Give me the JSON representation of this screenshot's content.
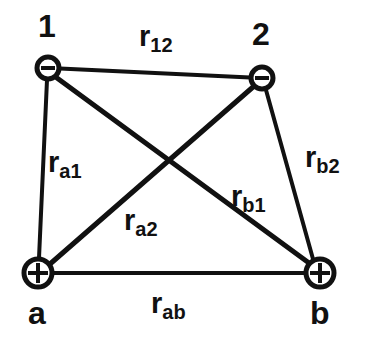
{
  "figure": {
    "background_color": "#ffffff",
    "ink_color": "#111111",
    "width": 365,
    "height": 345
  },
  "nodes": [
    {
      "id": "electron1",
      "label": "1",
      "charge_glyph": "minus",
      "charge_symbol": "−",
      "x": 48,
      "y": 68,
      "radius": 12,
      "label_x": 38,
      "label_y": 10
    },
    {
      "id": "electron2",
      "label": "2",
      "charge_glyph": "minus",
      "charge_symbol": "−",
      "x": 262,
      "y": 78,
      "radius": 12,
      "label_x": 252,
      "label_y": 18
    },
    {
      "id": "nucleusA",
      "label": "a",
      "charge_glyph": "plus",
      "charge_symbol": "+",
      "x": 38,
      "y": 273,
      "radius": 15,
      "label_x": 28,
      "label_y": 297
    },
    {
      "id": "nucleusB",
      "label": "b",
      "charge_glyph": "plus",
      "charge_symbol": "+",
      "x": 320,
      "y": 273,
      "radius": 15,
      "label_x": 310,
      "label_y": 297
    }
  ],
  "edges": [
    {
      "id": "r12",
      "from": "electron1",
      "to": "electron2",
      "base": "r",
      "subscript": "12",
      "label_x": 139,
      "label_y": 22,
      "stroke_width": 4
    },
    {
      "id": "ra1",
      "from": "nucleusA",
      "to": "electron1",
      "base": "r",
      "subscript": "a1",
      "label_x": 48,
      "label_y": 148,
      "stroke_width": 4
    },
    {
      "id": "rb2",
      "from": "nucleusB",
      "to": "electron2",
      "base": "r",
      "subscript": "b2",
      "label_x": 305,
      "label_y": 143,
      "stroke_width": 4
    },
    {
      "id": "rb1",
      "from": "nucleusB",
      "to": "electron1",
      "base": "r",
      "subscript": "b1",
      "label_x": 231,
      "label_y": 182,
      "stroke_width": 5
    },
    {
      "id": "ra2",
      "from": "nucleusA",
      "to": "electron2",
      "base": "r",
      "subscript": "a2",
      "label_x": 124,
      "label_y": 206,
      "stroke_width": 5
    },
    {
      "id": "rab",
      "from": "nucleusA",
      "to": "nucleusB",
      "base": "r",
      "subscript": "ab",
      "label_x": 151,
      "label_y": 289,
      "stroke_width": 4
    }
  ]
}
